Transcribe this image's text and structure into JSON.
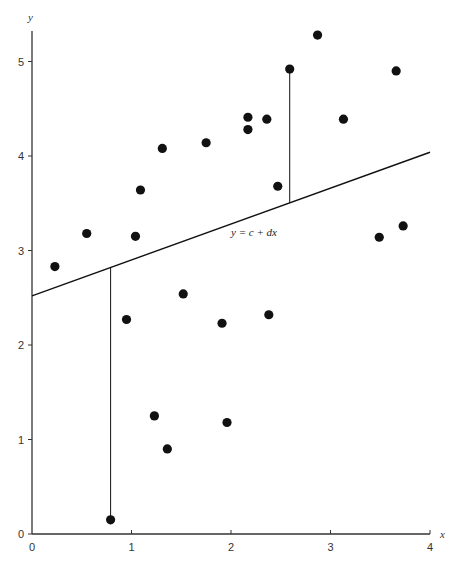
{
  "chart_data": {
    "type": "scatter",
    "title": "",
    "xlabel": "x",
    "ylabel": "y",
    "xlim": [
      0,
      4
    ],
    "ylim": [
      0,
      5.3
    ],
    "x_ticks": [
      "0",
      "1",
      "2",
      "3",
      "4"
    ],
    "y_ticks": [
      "0",
      "1",
      "2",
      "3",
      "4",
      "5"
    ],
    "grid": false,
    "legend": null,
    "series": [
      {
        "name": "observations",
        "points": [
          [
            0.23,
            2.83
          ],
          [
            0.55,
            3.18
          ],
          [
            1.04,
            3.15
          ],
          [
            1.09,
            3.64
          ],
          [
            1.31,
            4.08
          ],
          [
            1.75,
            4.14
          ],
          [
            2.17,
            4.41
          ],
          [
            2.17,
            4.28
          ],
          [
            2.36,
            4.39
          ],
          [
            2.47,
            3.68
          ],
          [
            2.59,
            4.92
          ],
          [
            2.87,
            5.28
          ],
          [
            3.13,
            4.39
          ],
          [
            3.66,
            4.9
          ],
          [
            3.49,
            3.14
          ],
          [
            3.73,
            3.26
          ],
          [
            0.95,
            2.27
          ],
          [
            1.52,
            2.54
          ],
          [
            1.91,
            2.23
          ],
          [
            2.38,
            2.32
          ],
          [
            1.23,
            1.25
          ],
          [
            1.36,
            0.9
          ],
          [
            1.96,
            1.18
          ],
          [
            0.79,
            0.15
          ]
        ]
      }
    ],
    "fit_line": {
      "label": "y = c + dx",
      "intercept": 2.52,
      "slope": 0.38,
      "x_range": [
        0,
        4
      ]
    },
    "residual_lines": [
      {
        "x": 0.79,
        "y_point": 0.15
      },
      {
        "x": 2.59,
        "y_point": 4.92
      }
    ],
    "annotations": [
      {
        "text": "y = c + dx",
        "x": 2.0,
        "y": 3.15
      }
    ]
  },
  "colors": {
    "axis": "#333333",
    "points": "#111111",
    "line": "#111111"
  }
}
